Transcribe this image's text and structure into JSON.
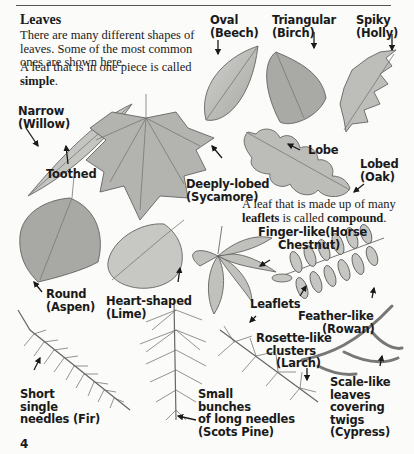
{
  "page": {
    "title": "Leaves",
    "intro": "There are many different shapes of leaves. Some of the most common ones are shown here.",
    "simple_text_prefix": "A leaf that is in one piece is called ",
    "simple_term": "simple",
    "simple_suffix": ".",
    "compound_text_prefix": "A leaf that is made up of many ",
    "compound_term1": "leaflets",
    "compound_text_mid": " is called ",
    "compound_term2": "compound",
    "compound_suffix": ".",
    "page_number": "4"
  },
  "colors": {
    "leaf_fill": "#b9b9b5",
    "leaf_dark": "#8e8e8a",
    "vein": "#6e6e6a",
    "ink": "#1a1a1a",
    "background": "#fbfbf9"
  },
  "labels": {
    "oval": [
      "Oval",
      "(Beech)"
    ],
    "triangular": [
      "Triangular",
      "(Birch)"
    ],
    "spiky": [
      "Spiky",
      "(Holly)"
    ],
    "narrow": [
      "Narrow",
      "(Willow)"
    ],
    "toothed": [
      "Toothed"
    ],
    "lobe": [
      "Lobe"
    ],
    "lobed": [
      "Lobed",
      "(Oak)"
    ],
    "deeply_lobed": [
      "Deeply-lobed",
      "(Sycamore)"
    ],
    "round": [
      "Round",
      "(Aspen)"
    ],
    "heart": [
      "Heart-shaped",
      "(Lime)"
    ],
    "finger": [
      "Finger-like(Horse",
      "Chestnut)"
    ],
    "leaflets": [
      "Leaflets"
    ],
    "feather": [
      "Feather-like",
      "(Rowan)"
    ],
    "rosette": [
      "Rosette-like",
      "clusters",
      "(Larch)"
    ],
    "short_needles": [
      "Short",
      "single",
      "needles (Fir)"
    ],
    "long_needles": [
      "Small",
      "bunches",
      "of long needles",
      "(Scots Pine)"
    ],
    "scale": [
      "Scale-like",
      "leaves",
      "covering",
      "twigs",
      "(Cypress)"
    ]
  }
}
